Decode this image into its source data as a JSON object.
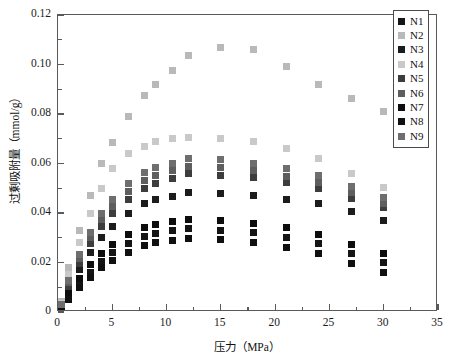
{
  "chart_data": {
    "type": "scatter",
    "title": "",
    "xlabel": "压力（MPa）",
    "ylabel": "过剩吸附量（mmol/g）",
    "xlim": [
      0,
      35
    ],
    "ylim": [
      0,
      0.12
    ],
    "xticks": [
      0,
      5,
      10,
      15,
      20,
      25,
      30,
      35
    ],
    "yticks": [
      0,
      0.02,
      0.04,
      0.06,
      0.08,
      0.1,
      0.12
    ],
    "ytick_labels": [
      "0",
      "0.02",
      "0.04",
      "0.06",
      "0.08",
      "0.10",
      "0.12"
    ],
    "xtick_labels": [
      "0",
      "5",
      "10",
      "15",
      "20",
      "25",
      "30",
      "35"
    ],
    "grid": false,
    "legend_position": "top-right",
    "marker": "square",
    "x": [
      0.3,
      1.0,
      2.0,
      3.0,
      4.0,
      5.0,
      6.5,
      8.0,
      9.0,
      10.5,
      12.0,
      15.0,
      18.0,
      21.0,
      24.0,
      27.0,
      30.0
    ],
    "series": [
      {
        "name": "N1",
        "color": "#151515",
        "values": [
          0.0015,
          0.0065,
          0.0115,
          0.016,
          0.0205,
          0.024,
          0.0278,
          0.0305,
          0.0318,
          0.033,
          0.0337,
          0.033,
          0.032,
          0.03,
          0.0275,
          0.0235,
          0.02
        ]
      },
      {
        "name": "N2",
        "color": "#b9b9b9",
        "values": [
          0.0042,
          0.018,
          0.033,
          0.047,
          0.06,
          0.0685,
          0.079,
          0.0875,
          0.092,
          0.0975,
          0.1038,
          0.1068,
          0.1062,
          0.0992,
          0.092,
          0.0862,
          0.0812
        ]
      },
      {
        "name": "N3",
        "color": "#1c1c1c",
        "values": [
          0.0022,
          0.0092,
          0.017,
          0.024,
          0.03,
          0.0345,
          0.0398,
          0.044,
          0.0455,
          0.0468,
          0.0482,
          0.0478,
          0.047,
          0.0455,
          0.0438,
          0.0405,
          0.037
        ]
      },
      {
        "name": "N4",
        "color": "#c9c9c9",
        "values": [
          0.0035,
          0.015,
          0.028,
          0.04,
          0.05,
          0.0578,
          0.064,
          0.067,
          0.069,
          0.07,
          0.0705,
          0.07,
          0.069,
          0.066,
          0.0622,
          0.056,
          0.0505
        ]
      },
      {
        "name": "N5",
        "color": "#3d3d3d",
        "values": [
          0.0025,
          0.0105,
          0.0195,
          0.0275,
          0.0345,
          0.0398,
          0.0455,
          0.05,
          0.052,
          0.054,
          0.0558,
          0.0552,
          0.0542,
          0.0522,
          0.0498,
          0.046,
          0.0422
        ]
      },
      {
        "name": "N6",
        "color": "#5e5e5e",
        "values": [
          0.0028,
          0.0118,
          0.0215,
          0.03,
          0.0372,
          0.0428,
          0.0488,
          0.0532,
          0.0552,
          0.057,
          0.0588,
          0.0582,
          0.057,
          0.0548,
          0.0522,
          0.0482,
          0.044
        ]
      },
      {
        "name": "N7",
        "color": "#0d0d0d",
        "values": [
          0.0018,
          0.0075,
          0.0135,
          0.019,
          0.0235,
          0.0272,
          0.0312,
          0.0342,
          0.0355,
          0.0365,
          0.0372,
          0.0368,
          0.0358,
          0.034,
          0.0312,
          0.0272,
          0.0238
        ]
      },
      {
        "name": "N8",
        "color": "#101010",
        "values": [
          0.0012,
          0.0052,
          0.0098,
          0.014,
          0.0178,
          0.0208,
          0.0242,
          0.0268,
          0.028,
          0.029,
          0.0298,
          0.0292,
          0.0282,
          0.0262,
          0.0235,
          0.0195,
          0.0158
        ]
      },
      {
        "name": "N9",
        "color": "#6e6e6e",
        "values": [
          0.003,
          0.0128,
          0.0232,
          0.0322,
          0.0398,
          0.0455,
          0.0518,
          0.0562,
          0.0582,
          0.0602,
          0.062,
          0.0615,
          0.0602,
          0.0578,
          0.055,
          0.0508,
          0.0462
        ]
      }
    ]
  }
}
